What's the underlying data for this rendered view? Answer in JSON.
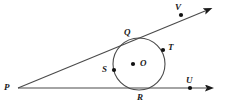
{
  "figure": {
    "kind": "geometry-diagram",
    "width": 228,
    "height": 107,
    "background_color": "#ffffff",
    "stroke_color": "#4a4a4a",
    "dot_color": "#111111",
    "label_color": "#1a1a1a"
  },
  "circle": {
    "center_label": "O",
    "center_x": 139,
    "center_y": 64,
    "radius": 26
  },
  "points": {
    "P": {
      "label": "P",
      "x": 18,
      "y": 88,
      "label_x": 4,
      "label_y": 83,
      "has_dot": false
    },
    "Q": {
      "label": "Q",
      "x": 123,
      "y": 40,
      "label_x": 124,
      "label_y": 28,
      "has_dot": false
    },
    "V": {
      "label": "V",
      "x": 181,
      "y": 15,
      "label_x": 175,
      "label_y": 3,
      "has_dot": true
    },
    "T": {
      "label": "T",
      "x": 163,
      "y": 50,
      "label_x": 168,
      "label_y": 43,
      "has_dot": true
    },
    "S": {
      "label": "S",
      "x": 114,
      "y": 70,
      "label_x": 102,
      "label_y": 65,
      "has_dot": true
    },
    "O": {
      "label": "O",
      "x": 133,
      "y": 64,
      "label_x": 140,
      "label_y": 59,
      "has_dot": true
    },
    "R": {
      "label": "R",
      "x": 140,
      "y": 90,
      "label_x": 137,
      "label_y": 93,
      "has_dot": false
    },
    "U": {
      "label": "U",
      "x": 190,
      "y": 88,
      "label_x": 186,
      "label_y": 76,
      "has_dot": true
    }
  },
  "rays": [
    {
      "name": "ray-PV",
      "from": "P",
      "through": "Q",
      "to_label": "V",
      "x1": 18,
      "y1": 88,
      "x2": 213,
      "y2": 8,
      "arrow": true
    },
    {
      "name": "ray-PU",
      "from": "P",
      "through": "R",
      "to_label": "U",
      "x1": 18,
      "y1": 88,
      "x2": 214,
      "y2": 88,
      "arrow": true
    }
  ]
}
